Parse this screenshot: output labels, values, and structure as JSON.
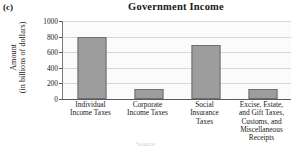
{
  "panel": {
    "label": "(c)"
  },
  "bottom_fragment": {
    "text": "Source"
  },
  "chart_data": {
    "type": "bar",
    "title": "Government Income",
    "xlabel": "",
    "ylabel_line1": "Amount",
    "ylabel_line2": "(in billions of dollars)",
    "categories": [
      "Individual Income Taxes",
      "Corporate Income Taxes",
      "Social Insurance Taxes",
      "Excise, Estate, and Gift Taxes, Customs, and Miscellaneous Receipts"
    ],
    "category_lines": [
      [
        "Individual",
        "Income Taxes"
      ],
      [
        "Corporate",
        "Income Taxes"
      ],
      [
        "Social",
        "Insurance",
        "Taxes"
      ],
      [
        "Excise, Estate,",
        "and Gift Taxes,",
        "Customs, and",
        "Miscellaneous",
        "Receipts"
      ]
    ],
    "values": [
      800,
      130,
      690,
      125
    ],
    "ylim": [
      0,
      1000
    ],
    "yticks": [
      0,
      200,
      400,
      600,
      800,
      1000
    ],
    "ytick_labels": [
      "0",
      "200",
      "400",
      "600",
      "800",
      "1000"
    ],
    "grid": true,
    "legend": false,
    "bar_color": "#9d9d9d",
    "bar_edge_color": "#6f6f6f",
    "plot_background": "#fbfbfb",
    "gridline_color": "#d8d8d8"
  }
}
